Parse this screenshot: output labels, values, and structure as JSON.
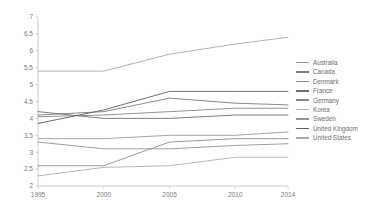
{
  "chart_data": {
    "type": "line",
    "title": "",
    "xlabel": "",
    "ylabel": "",
    "x": [
      1995,
      2000,
      2005,
      2010,
      2014
    ],
    "xtick_labels": [
      "1995",
      "2000",
      "2005",
      "2010",
      "2014"
    ],
    "ytick_labels": [
      "2",
      "2.5",
      "3",
      "3.5",
      "4",
      "4.5",
      "5",
      "5.5",
      "6",
      "6.5",
      "7"
    ],
    "yticks": [
      2,
      2.5,
      3,
      3.5,
      4,
      4.5,
      5,
      5.5,
      6,
      6.5,
      7
    ],
    "ylim": [
      2,
      7
    ],
    "xlim": [
      1995,
      2014
    ],
    "grid": false,
    "legend_position": "right",
    "series": [
      {
        "name": "Australia",
        "color": "#9a9a9a",
        "values": [
          3.4,
          3.4,
          3.5,
          3.5,
          3.6
        ]
      },
      {
        "name": "Canada",
        "color": "#7d7d7d",
        "values": [
          4.1,
          4.2,
          4.6,
          4.45,
          4.4
        ]
      },
      {
        "name": "Denmark",
        "color": "#8c8c8c",
        "values": [
          2.6,
          2.6,
          3.3,
          3.4,
          3.4
        ]
      },
      {
        "name": "France",
        "color": "#6f6f6f",
        "values": [
          4.2,
          4.0,
          4.0,
          4.1,
          4.1
        ]
      },
      {
        "name": "Germany",
        "color": "#868686",
        "values": [
          4.05,
          4.1,
          4.2,
          4.3,
          4.3
        ]
      },
      {
        "name": "Korea",
        "color": "#b0b0b0",
        "values": [
          2.3,
          2.55,
          2.6,
          2.85,
          2.85
        ]
      },
      {
        "name": "Sweden",
        "color": "#949494",
        "values": [
          3.3,
          3.1,
          3.1,
          3.2,
          3.25
        ]
      },
      {
        "name": "United Kingdom",
        "color": "#5f5f5f",
        "values": [
          3.85,
          4.25,
          4.8,
          4.8,
          4.8
        ]
      },
      {
        "name": "United States",
        "color": "#a8a8a8",
        "values": [
          5.4,
          5.4,
          5.9,
          6.2,
          6.4
        ]
      }
    ]
  },
  "legend": {
    "items": [
      {
        "label": "Australia"
      },
      {
        "label": "Canada"
      },
      {
        "label": "Denmark"
      },
      {
        "label": "France"
      },
      {
        "label": "Germany"
      },
      {
        "label": "Korea"
      },
      {
        "label": "Sweden"
      },
      {
        "label": "United Kingdom"
      },
      {
        "label": "United States"
      }
    ]
  }
}
